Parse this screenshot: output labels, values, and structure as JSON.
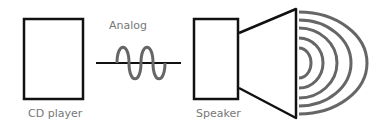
{
  "diagram": {
    "nodes": [
      {
        "id": "cd-player",
        "label": "CD player"
      },
      {
        "id": "speaker",
        "label": "Speaker"
      }
    ],
    "signal": {
      "label": "Analog",
      "type": "sine-wave"
    },
    "colors": {
      "stroke": "#111111",
      "wave": "#666666",
      "text": "#777777"
    }
  }
}
